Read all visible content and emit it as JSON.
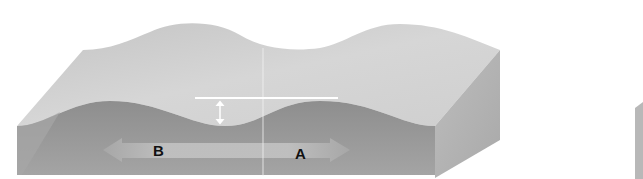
{
  "diagram": {
    "labels": {
      "left": "B",
      "right": "A"
    },
    "annotations": {
      "reference_line": "horizontal white crest line",
      "amplitude_marker": "vertical double-headed arrow",
      "direction_arrow": "double-headed arrow between B and A"
    },
    "colors": {
      "top_surface": "#c9c9c9",
      "top_surface_highlight": "#dcdcdc",
      "front_face": "#9a9a9a",
      "front_face_dark": "#8a8a8a",
      "side_face": "#b2b2b2",
      "arrow_band": "#bdbdbd",
      "marker_white": "#ffffff",
      "background": "#ffffff"
    }
  }
}
